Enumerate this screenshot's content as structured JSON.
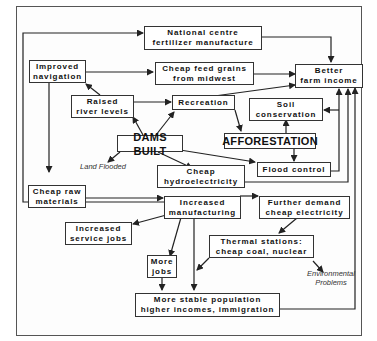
{
  "diagram": {
    "type": "flowchart",
    "nodes": {
      "national_centre": [
        "National centre",
        "fertilizer manufacture"
      ],
      "improved_navigation": [
        "Improved",
        "navigation"
      ],
      "cheap_feed_grains": [
        "Cheap feed grains",
        "from midwest"
      ],
      "better_farm_income": [
        "Better",
        "farm income"
      ],
      "raised_river_levels": [
        "Raised",
        "river levels"
      ],
      "recreation": [
        "Recreation"
      ],
      "soil_conservation": [
        "Soil",
        "conservation"
      ],
      "dams_built": [
        "DAMS BUILT"
      ],
      "afforestation": [
        "AFFORESTATION"
      ],
      "cheap_hydroelectricity": [
        "Cheap",
        "hydroelectricity"
      ],
      "flood_control": [
        "Flood control"
      ],
      "cheap_raw_materials": [
        "Cheap raw",
        "materials"
      ],
      "increased_manufacturing": [
        "Increased",
        "manufacturing"
      ],
      "further_demand": [
        "Further demand",
        "cheap electricity"
      ],
      "increased_service_jobs": [
        "Increased",
        "service jobs"
      ],
      "thermal_stations": [
        "Thermal stations:",
        "cheap coal, nuclear"
      ],
      "more_jobs": [
        "More",
        "jobs"
      ],
      "stable_population": [
        "More stable population",
        "higher incomes, immigration"
      ]
    },
    "notes": {
      "land_flooded": "Land Flooded",
      "environmental_problems": [
        "Environmental",
        "Problems"
      ]
    },
    "edges": [
      [
        "dams_built",
        "raised_river_levels"
      ],
      [
        "dams_built",
        "recreation"
      ],
      [
        "dams_built",
        "land_flooded"
      ],
      [
        "dams_built",
        "cheap_hydroelectricity"
      ],
      [
        "dams_built",
        "flood_control"
      ],
      [
        "raised_river_levels",
        "improved_navigation"
      ],
      [
        "raised_river_levels",
        "recreation"
      ],
      [
        "improved_navigation",
        "cheap_feed_grains"
      ],
      [
        "improved_navigation",
        "cheap_raw_materials"
      ],
      [
        "cheap_feed_grains",
        "better_farm_income"
      ],
      [
        "recreation",
        "better_farm_income"
      ],
      [
        "recreation",
        "afforestation"
      ],
      [
        "afforestation",
        "soil_conservation"
      ],
      [
        "afforestation",
        "flood_control"
      ],
      [
        "soil_conservation",
        "better_farm_income"
      ],
      [
        "flood_control",
        "better_farm_income"
      ],
      [
        "cheap_hydroelectricity",
        "better_farm_income"
      ],
      [
        "national_centre",
        "better_farm_income"
      ],
      [
        "cheap_raw_materials",
        "increased_manufacturing"
      ],
      [
        "increased_manufacturing",
        "further_demand"
      ],
      [
        "increased_manufacturing",
        "increased_service_jobs"
      ],
      [
        "increased_manufacturing",
        "more_jobs"
      ],
      [
        "increased_manufacturing",
        "stable_population"
      ],
      [
        "increased_manufacturing",
        "national_centre"
      ],
      [
        "further_demand",
        "thermal_stations"
      ],
      [
        "thermal_stations",
        "stable_population"
      ],
      [
        "thermal_stations",
        "environmental_problems"
      ],
      [
        "more_jobs",
        "stable_population"
      ],
      [
        "stable_population",
        "better_farm_income"
      ]
    ]
  },
  "labels": {
    "national_centre_1": "National centre",
    "national_centre_2": "fertilizer manufacture",
    "improved_navigation_1": "Improved",
    "improved_navigation_2": "navigation",
    "cheap_feed_grains_1": "Cheap feed grains",
    "cheap_feed_grains_2": "from midwest",
    "better_farm_income_1": "Better",
    "better_farm_income_2": "farm income",
    "raised_river_levels_1": "Raised",
    "raised_river_levels_2": "river levels",
    "recreation": "Recreation",
    "soil_conservation_1": "Soil",
    "soil_conservation_2": "conservation",
    "dams_built": "DAMS BUILT",
    "afforestation": "AFFORESTATION",
    "land_flooded": "Land Flooded",
    "cheap_hydroelectricity_1": "Cheap",
    "cheap_hydroelectricity_2": "hydroelectricity",
    "flood_control": "Flood control",
    "cheap_raw_materials_1": "Cheap raw",
    "cheap_raw_materials_2": "materials",
    "increased_manufacturing_1": "Increased",
    "increased_manufacturing_2": "manufacturing",
    "further_demand_1": "Further demand",
    "further_demand_2": "cheap electricity",
    "increased_service_jobs_1": "Increased",
    "increased_service_jobs_2": "service jobs",
    "thermal_stations_1": "Thermal stations:",
    "thermal_stations_2": "cheap coal, nuclear",
    "environmental_problems_1": "Environmental",
    "environmental_problems_2": "Problems",
    "more_jobs_1": "More",
    "more_jobs_2": "jobs",
    "stable_population_1": "More stable population",
    "stable_population_2": "higher incomes, immigration"
  },
  "colors": {
    "line": "#222222",
    "box_border": "#333333",
    "background": "#ffffff"
  }
}
